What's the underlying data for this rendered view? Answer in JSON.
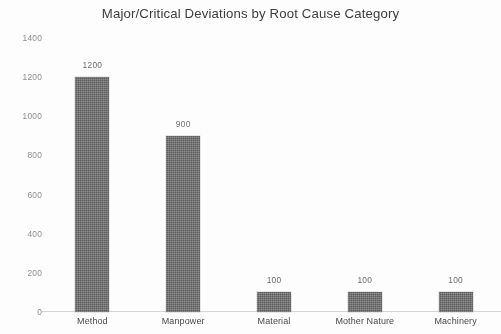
{
  "chart_data": {
    "type": "bar",
    "title": "Major/Critical Deviations by Root Cause Category",
    "xlabel": "",
    "ylabel": "",
    "categories": [
      "Method",
      "Manpower",
      "Material",
      "Mother Nature",
      "Machinery"
    ],
    "values": [
      1200,
      900,
      100,
      100,
      100
    ],
    "data_labels": [
      "1200",
      "900",
      "100",
      "100",
      "100"
    ],
    "ylim": [
      0,
      1400
    ],
    "y_ticks": [
      1400,
      1200,
      1000,
      800,
      600,
      400,
      200,
      0
    ],
    "y_tick_labels": [
      "1400",
      "1200",
      "1000",
      "800",
      "600",
      "400",
      "200",
      "0"
    ],
    "grid": false,
    "legend": false,
    "bar_color": "#5e5e5e",
    "background_color": "#ffffff",
    "title_color": "#3d3d3d",
    "tick_color": "#8d8d8d"
  }
}
